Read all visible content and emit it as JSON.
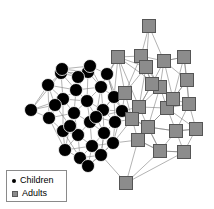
{
  "figure": {
    "background_color": "#ffffff",
    "edge_color": "#808080",
    "edge_width": 0.6
  },
  "legend": {
    "border_color": "#8a8a8a",
    "items": [
      {
        "label": "Children",
        "marker": "filled-circle",
        "color": "#000000"
      },
      {
        "label": "Adults",
        "marker": "filled-square",
        "color": "#8c8c8c"
      }
    ]
  },
  "chart_data": {
    "type": "scatter",
    "title": "",
    "xlabel": "",
    "ylabel": "",
    "grid": false,
    "legend_position": "bottom-left",
    "groups": [
      {
        "name": "Children",
        "marker": "circle",
        "color": "#000000",
        "node_size": 13,
        "count": 31
      },
      {
        "name": "Adults",
        "marker": "square",
        "color": "#8c8c8c",
        "edge_color": "#555555",
        "node_size": 13,
        "count": 22
      }
    ],
    "nodes": [
      {
        "id": "c1",
        "group": "Children",
        "x": 31,
        "y": 110
      },
      {
        "id": "c2",
        "group": "Children",
        "x": 48,
        "y": 85
      },
      {
        "id": "c3",
        "group": "Children",
        "x": 49,
        "y": 118
      },
      {
        "id": "c4",
        "group": "Children",
        "x": 61,
        "y": 73
      },
      {
        "id": "c5",
        "group": "Children",
        "x": 63,
        "y": 99
      },
      {
        "id": "c6",
        "group": "Children",
        "x": 63,
        "y": 131
      },
      {
        "id": "c7",
        "group": "Children",
        "x": 65,
        "y": 150
      },
      {
        "id": "c8",
        "group": "Children",
        "x": 74,
        "y": 113
      },
      {
        "id": "c9",
        "group": "Children",
        "x": 76,
        "y": 90
      },
      {
        "id": "c10",
        "group": "Children",
        "x": 62,
        "y": 69
      },
      {
        "id": "c11",
        "group": "Children",
        "x": 78,
        "y": 135
      },
      {
        "id": "c12",
        "group": "Children",
        "x": 80,
        "y": 158
      },
      {
        "id": "c13",
        "group": "Children",
        "x": 88,
        "y": 72
      },
      {
        "id": "c14",
        "group": "Children",
        "x": 87,
        "y": 101
      },
      {
        "id": "c15",
        "group": "Children",
        "x": 90,
        "y": 122
      },
      {
        "id": "c16",
        "group": "Children",
        "x": 92,
        "y": 146
      },
      {
        "id": "c17",
        "group": "Children",
        "x": 88,
        "y": 166
      },
      {
        "id": "c18",
        "group": "Children",
        "x": 101,
        "y": 87
      },
      {
        "id": "c19",
        "group": "Children",
        "x": 103,
        "y": 110
      },
      {
        "id": "c20",
        "group": "Children",
        "x": 104,
        "y": 133
      },
      {
        "id": "c21",
        "group": "Children",
        "x": 101,
        "y": 155
      },
      {
        "id": "c22",
        "group": "Children",
        "x": 114,
        "y": 97
      },
      {
        "id": "c23",
        "group": "Children",
        "x": 115,
        "y": 122
      },
      {
        "id": "c24",
        "group": "Children",
        "x": 113,
        "y": 143
      },
      {
        "id": "c25",
        "group": "Children",
        "x": 90,
        "y": 66
      },
      {
        "id": "c26",
        "group": "Children",
        "x": 78,
        "y": 77
      },
      {
        "id": "c27",
        "group": "Children",
        "x": 55,
        "y": 105
      },
      {
        "id": "c28",
        "group": "Children",
        "x": 70,
        "y": 126
      },
      {
        "id": "c29",
        "group": "Children",
        "x": 96,
        "y": 117
      },
      {
        "id": "c30",
        "group": "Children",
        "x": 107,
        "y": 74
      },
      {
        "id": "c31",
        "group": "Children",
        "x": 122,
        "y": 111
      },
      {
        "id": "a1",
        "group": "Adults",
        "x": 149,
        "y": 26
      },
      {
        "id": "a2",
        "group": "Adults",
        "x": 118,
        "y": 57
      },
      {
        "id": "a3",
        "group": "Adults",
        "x": 141,
        "y": 56
      },
      {
        "id": "a4",
        "group": "Adults",
        "x": 164,
        "y": 61
      },
      {
        "id": "a5",
        "group": "Adults",
        "x": 184,
        "y": 57
      },
      {
        "id": "a6",
        "group": "Adults",
        "x": 146,
        "y": 67
      },
      {
        "id": "a7",
        "group": "Adults",
        "x": 187,
        "y": 80
      },
      {
        "id": "a8",
        "group": "Adults",
        "x": 160,
        "y": 87
      },
      {
        "id": "a9",
        "group": "Adults",
        "x": 139,
        "y": 107
      },
      {
        "id": "a10",
        "group": "Adults",
        "x": 167,
        "y": 108
      },
      {
        "id": "a11",
        "group": "Adults",
        "x": 189,
        "y": 104
      },
      {
        "id": "a12",
        "group": "Adults",
        "x": 125,
        "y": 93
      },
      {
        "id": "a13",
        "group": "Adults",
        "x": 148,
        "y": 127
      },
      {
        "id": "a14",
        "group": "Adults",
        "x": 176,
        "y": 131
      },
      {
        "id": "a15",
        "group": "Adults",
        "x": 196,
        "y": 129
      },
      {
        "id": "a16",
        "group": "Adults",
        "x": 132,
        "y": 119
      },
      {
        "id": "a17",
        "group": "Adults",
        "x": 160,
        "y": 151
      },
      {
        "id": "a18",
        "group": "Adults",
        "x": 184,
        "y": 152
      },
      {
        "id": "a19",
        "group": "Adults",
        "x": 138,
        "y": 140
      },
      {
        "id": "a20",
        "group": "Adults",
        "x": 126,
        "y": 183
      },
      {
        "id": "a21",
        "group": "Adults",
        "x": 173,
        "y": 99
      },
      {
        "id": "a22",
        "group": "Adults",
        "x": 152,
        "y": 84
      }
    ],
    "edges": [
      [
        "c1",
        "c2"
      ],
      [
        "c1",
        "c3"
      ],
      [
        "c1",
        "c5"
      ],
      [
        "c1",
        "c4"
      ],
      [
        "c1",
        "c27"
      ],
      [
        "c2",
        "c3"
      ],
      [
        "c2",
        "c4"
      ],
      [
        "c2",
        "c5"
      ],
      [
        "c2",
        "c27"
      ],
      [
        "c2",
        "c9"
      ],
      [
        "c3",
        "c5"
      ],
      [
        "c3",
        "c6"
      ],
      [
        "c3",
        "c27"
      ],
      [
        "c3",
        "c7"
      ],
      [
        "c3",
        "c8"
      ],
      [
        "c4",
        "c5"
      ],
      [
        "c4",
        "c9"
      ],
      [
        "c4",
        "c26"
      ],
      [
        "c4",
        "c10"
      ],
      [
        "c4",
        "c13"
      ],
      [
        "c5",
        "c8"
      ],
      [
        "c5",
        "c9"
      ],
      [
        "c5",
        "c27"
      ],
      [
        "c5",
        "c6"
      ],
      [
        "c5",
        "c14"
      ],
      [
        "c6",
        "c7"
      ],
      [
        "c6",
        "c8"
      ],
      [
        "c6",
        "c11"
      ],
      [
        "c6",
        "c28"
      ],
      [
        "c6",
        "c12"
      ],
      [
        "c7",
        "c11"
      ],
      [
        "c7",
        "c12"
      ],
      [
        "c7",
        "c28"
      ],
      [
        "c7",
        "c16"
      ],
      [
        "c8",
        "c9"
      ],
      [
        "c8",
        "c11"
      ],
      [
        "c8",
        "c14"
      ],
      [
        "c8",
        "c28"
      ],
      [
        "c8",
        "c15"
      ],
      [
        "c9",
        "c13"
      ],
      [
        "c9",
        "c14"
      ],
      [
        "c9",
        "c26"
      ],
      [
        "c9",
        "c18"
      ],
      [
        "c10",
        "c13"
      ],
      [
        "c10",
        "c26"
      ],
      [
        "c10",
        "c25"
      ],
      [
        "c11",
        "c12"
      ],
      [
        "c11",
        "c15"
      ],
      [
        "c11",
        "c16"
      ],
      [
        "c11",
        "c28"
      ],
      [
        "c12",
        "c16"
      ],
      [
        "c12",
        "c17"
      ],
      [
        "c12",
        "c21"
      ],
      [
        "c13",
        "c18"
      ],
      [
        "c13",
        "c25"
      ],
      [
        "c13",
        "c26"
      ],
      [
        "c13",
        "c14"
      ],
      [
        "c14",
        "c18"
      ],
      [
        "c14",
        "c19"
      ],
      [
        "c14",
        "c29"
      ],
      [
        "c14",
        "c15"
      ],
      [
        "c15",
        "c19"
      ],
      [
        "c15",
        "c20"
      ],
      [
        "c15",
        "c29"
      ],
      [
        "c15",
        "c16"
      ],
      [
        "c16",
        "c20"
      ],
      [
        "c16",
        "c21"
      ],
      [
        "c16",
        "c24"
      ],
      [
        "c16",
        "c17"
      ],
      [
        "c17",
        "c21"
      ],
      [
        "c17",
        "c24"
      ],
      [
        "c18",
        "c19"
      ],
      [
        "c18",
        "c22"
      ],
      [
        "c18",
        "c25"
      ],
      [
        "c18",
        "c30"
      ],
      [
        "c18",
        "c29"
      ],
      [
        "c19",
        "c20"
      ],
      [
        "c19",
        "c22"
      ],
      [
        "c19",
        "c23"
      ],
      [
        "c19",
        "c29"
      ],
      [
        "c19",
        "c31"
      ],
      [
        "c20",
        "c21"
      ],
      [
        "c20",
        "c23"
      ],
      [
        "c20",
        "c24"
      ],
      [
        "c20",
        "c29"
      ],
      [
        "c21",
        "c24"
      ],
      [
        "c21",
        "c20"
      ],
      [
        "c22",
        "c23"
      ],
      [
        "c22",
        "c30"
      ],
      [
        "c22",
        "c31"
      ],
      [
        "c22",
        "c29"
      ],
      [
        "c23",
        "c24"
      ],
      [
        "c23",
        "c31"
      ],
      [
        "c23",
        "c29"
      ],
      [
        "c24",
        "c31"
      ],
      [
        "c25",
        "c26"
      ],
      [
        "c25",
        "c30"
      ],
      [
        "c27",
        "c28"
      ],
      [
        "c29",
        "c31"
      ],
      [
        "c30",
        "c31"
      ],
      [
        "c30",
        "c22"
      ],
      [
        "c22",
        "a12"
      ],
      [
        "c31",
        "a12"
      ],
      [
        "c31",
        "a9"
      ],
      [
        "c30",
        "a2"
      ],
      [
        "c23",
        "a16"
      ],
      [
        "c24",
        "a19"
      ],
      [
        "c31",
        "a16"
      ],
      [
        "c22",
        "a2"
      ],
      [
        "c21",
        "a20"
      ],
      [
        "c24",
        "a16"
      ],
      [
        "c18",
        "a2"
      ],
      [
        "a1",
        "a3"
      ],
      [
        "a1",
        "a4"
      ],
      [
        "a1",
        "a6"
      ],
      [
        "a2",
        "a3"
      ],
      [
        "a2",
        "a6"
      ],
      [
        "a2",
        "a12"
      ],
      [
        "a2",
        "a9"
      ],
      [
        "a2",
        "a8"
      ],
      [
        "a3",
        "a4"
      ],
      [
        "a3",
        "a6"
      ],
      [
        "a3",
        "a8"
      ],
      [
        "a3",
        "a22"
      ],
      [
        "a3",
        "a12"
      ],
      [
        "a4",
        "a5"
      ],
      [
        "a4",
        "a8"
      ],
      [
        "a4",
        "a22"
      ],
      [
        "a4",
        "a21"
      ],
      [
        "a4",
        "a7"
      ],
      [
        "a5",
        "a7"
      ],
      [
        "a5",
        "a4"
      ],
      [
        "a5",
        "a21"
      ],
      [
        "a5",
        "a11"
      ],
      [
        "a6",
        "a8"
      ],
      [
        "a6",
        "a22"
      ],
      [
        "a6",
        "a9"
      ],
      [
        "a6",
        "a12"
      ],
      [
        "a7",
        "a11"
      ],
      [
        "a7",
        "a21"
      ],
      [
        "a7",
        "a10"
      ],
      [
        "a8",
        "a21"
      ],
      [
        "a8",
        "a22"
      ],
      [
        "a8",
        "a10"
      ],
      [
        "a8",
        "a9"
      ],
      [
        "a8",
        "a13"
      ],
      [
        "a9",
        "a12"
      ],
      [
        "a9",
        "a13"
      ],
      [
        "a9",
        "a16"
      ],
      [
        "a9",
        "a10"
      ],
      [
        "a9",
        "a22"
      ],
      [
        "a10",
        "a11"
      ],
      [
        "a10",
        "a13"
      ],
      [
        "a10",
        "a14"
      ],
      [
        "a10",
        "a21"
      ],
      [
        "a10",
        "a15"
      ],
      [
        "a11",
        "a15"
      ],
      [
        "a11",
        "a14"
      ],
      [
        "a11",
        "a21"
      ],
      [
        "a12",
        "a16"
      ],
      [
        "a12",
        "a9"
      ],
      [
        "a13",
        "a14"
      ],
      [
        "a13",
        "a16"
      ],
      [
        "a13",
        "a17"
      ],
      [
        "a13",
        "a19"
      ],
      [
        "a13",
        "a10"
      ],
      [
        "a14",
        "a15"
      ],
      [
        "a14",
        "a17"
      ],
      [
        "a14",
        "a18"
      ],
      [
        "a14",
        "a13"
      ],
      [
        "a15",
        "a18"
      ],
      [
        "a15",
        "a14"
      ],
      [
        "a16",
        "a19"
      ],
      [
        "a16",
        "a13"
      ],
      [
        "a17",
        "a18"
      ],
      [
        "a17",
        "a19"
      ],
      [
        "a17",
        "a20"
      ],
      [
        "a17",
        "a13"
      ],
      [
        "a18",
        "a20"
      ],
      [
        "a18",
        "a17"
      ],
      [
        "a19",
        "a20"
      ],
      [
        "a19",
        "a17"
      ],
      [
        "a21",
        "a22"
      ],
      [
        "a21",
        "a10"
      ],
      [
        "a22",
        "a9"
      ]
    ]
  }
}
